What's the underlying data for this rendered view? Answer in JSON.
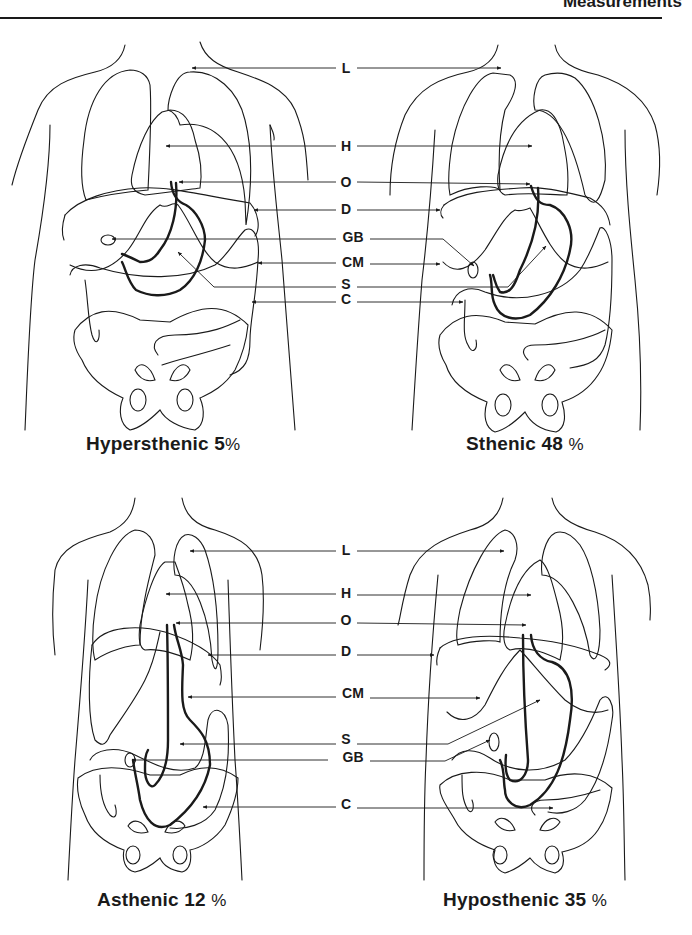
{
  "header": {
    "title": "Measurements"
  },
  "panels": [
    {
      "id": "hypersthenic",
      "type_name": "Hypersthenic",
      "percent": "5",
      "percent_sign": "%"
    },
    {
      "id": "sthenic",
      "type_name": "Sthenic",
      "percent": "48",
      "percent_sign": "%"
    },
    {
      "id": "asthenic",
      "type_name": "Asthenic",
      "percent": "12",
      "percent_sign": "%"
    },
    {
      "id": "hyposthenic",
      "type_name": "Hyposthenic",
      "percent": "35",
      "percent_sign": "%"
    }
  ],
  "top_labels": [
    {
      "key": "L",
      "meaning": "Lungs"
    },
    {
      "key": "H",
      "meaning": "Heart"
    },
    {
      "key": "O",
      "meaning": "Esophagus opening"
    },
    {
      "key": "D",
      "meaning": "Diaphragm"
    },
    {
      "key": "GB",
      "meaning": "Gallbladder"
    },
    {
      "key": "CM",
      "meaning": "Costal margin"
    },
    {
      "key": "S",
      "meaning": "Stomach"
    },
    {
      "key": "C",
      "meaning": "Colon"
    }
  ],
  "bottom_labels": [
    {
      "key": "L"
    },
    {
      "key": "H"
    },
    {
      "key": "O"
    },
    {
      "key": "D"
    },
    {
      "key": "CM"
    },
    {
      "key": "S"
    },
    {
      "key": "GB"
    },
    {
      "key": "C"
    }
  ],
  "colors": {
    "ink": "#1a1a1a",
    "background": "#ffffff"
  }
}
